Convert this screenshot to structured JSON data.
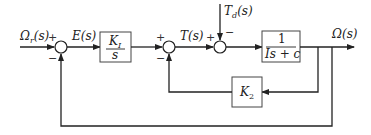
{
  "diagram": {
    "signals": {
      "reference": "Ωr(s)",
      "reference_main": "Ω",
      "reference_sub": "r",
      "reference_arg": "(s)",
      "error": "E(s)",
      "torque": "T(s)",
      "disturbance_main": "T",
      "disturbance_sub": "d",
      "disturbance_arg": "(s)",
      "output": "Ω(s)"
    },
    "blocks": {
      "integral_gain": {
        "numerator": "K",
        "numerator_sub": "I",
        "denominator": "s"
      },
      "plant": {
        "numerator": "1",
        "denominator": "Is + c"
      },
      "feedback_gain": {
        "label": "K",
        "label_sub": "2"
      }
    },
    "junctions": {
      "sum1": {
        "in_ref": "+",
        "in_fb": "−"
      },
      "sum2": {
        "in_main": "+",
        "in_fb": "−"
      },
      "sum3": {
        "in_main": "+",
        "in_dist": "−"
      }
    }
  }
}
